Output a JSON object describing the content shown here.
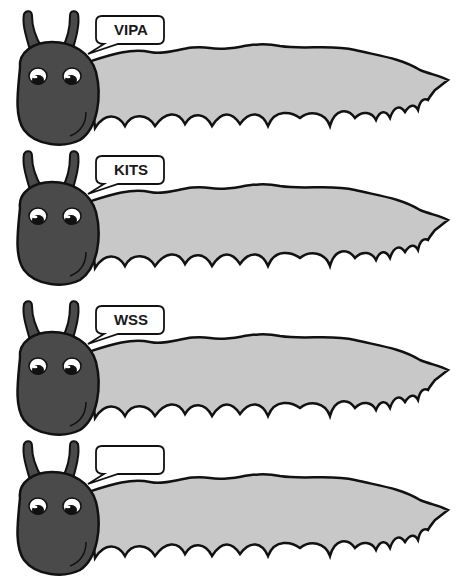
{
  "colors": {
    "head": "#4a4a4a",
    "body": "#c8c8c8",
    "outline": "#111111",
    "background": "#ffffff",
    "bubble": "#ffffff"
  },
  "caterpillars": [
    {
      "label": "VIPA",
      "top": 0
    },
    {
      "label": "KITS",
      "top": 140
    },
    {
      "label": "WSS",
      "top": 290
    },
    {
      "label": "",
      "top": 430
    }
  ]
}
